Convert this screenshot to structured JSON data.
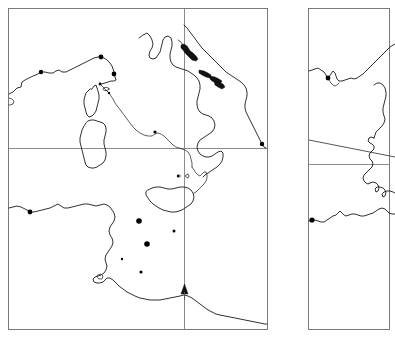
{
  "figure": {
    "type": "map-figure",
    "background_color": "#ffffff",
    "coastline_color": "#1a1a1a",
    "grid_color": "#8c8c8c",
    "frame_color": "#7a7a7a",
    "marker_color": "#000000",
    "panel_count": 2
  },
  "panels": [
    {
      "id": "panel-left",
      "name": "central-mediterranean-panel",
      "frame": {
        "x": 8,
        "y": 8,
        "width": 260,
        "height": 322
      },
      "gridlines": {
        "vertical": [
          184
        ],
        "horizontal": [
          148
        ]
      },
      "regions": [
        "Iberian and southern French coast",
        "Corsica",
        "Sardinia",
        "Italian peninsula",
        "Adriatic and Dalmatian coast",
        "Sicily",
        "Tunisia and Libya coast"
      ],
      "markers": {
        "arrow": {
          "x": 184,
          "y": 292,
          "direction": "up"
        },
        "sites": [
          {
            "x": 41,
            "y": 72
          },
          {
            "x": 101,
            "y": 57
          },
          {
            "x": 114,
            "y": 74
          },
          {
            "x": 100,
            "y": 84
          },
          {
            "x": 109,
            "y": 93
          },
          {
            "x": 155,
            "y": 132
          },
          {
            "x": 262,
            "y": 144
          },
          {
            "x": 30,
            "y": 212
          },
          {
            "x": 139,
            "y": 221
          },
          {
            "x": 174,
            "y": 231
          },
          {
            "x": 147,
            "y": 244
          },
          {
            "x": 122,
            "y": 259
          },
          {
            "x": 141,
            "y": 272
          },
          {
            "x": 178,
            "y": 176
          }
        ]
      }
    },
    {
      "id": "panel-right",
      "name": "eastern-mediterranean-panel",
      "frame": {
        "x": 308,
        "y": 8,
        "width": 82,
        "height": 322
      },
      "gridlines": {
        "vertical": [],
        "horizontal": [
          164
        ],
        "diagonal": [
          {
            "x1": 308,
            "y1": 140,
            "x2": 395,
            "y2": 156
          }
        ]
      },
      "regions": [
        "Northern Balkan coast",
        "Greek west coast",
        "Peloponnese",
        "North African coast"
      ],
      "markers": {
        "sites": [
          {
            "x": 328,
            "y": 78
          },
          {
            "x": 312,
            "y": 220
          }
        ]
      }
    }
  ]
}
